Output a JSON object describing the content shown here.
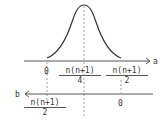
{
  "diagram": {
    "type": "bell-curve-with-dual-axes",
    "colors": {
      "line": "#555555",
      "curve": "#333333",
      "dashed": "#888888",
      "text": "#333333"
    },
    "curve": {
      "shape": "normal-distribution",
      "peak_at": "n(n+1)/4"
    },
    "axis_a": {
      "label": "a",
      "direction": "right",
      "ticks": [
        {
          "label": "0"
        },
        {
          "num": "n(n+1)",
          "den": "4"
        },
        {
          "num": "n(n+1)",
          "den": "2"
        }
      ]
    },
    "axis_b": {
      "label": "b",
      "direction": "left",
      "ticks": [
        {
          "num": "n(n+1)",
          "den": "2"
        },
        {
          "label": "0"
        }
      ]
    }
  }
}
